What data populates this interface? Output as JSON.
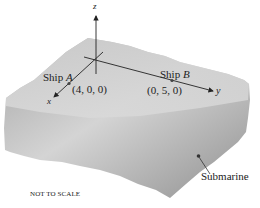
{
  "diagram": {
    "axes": {
      "x_label": "x",
      "y_label": "y",
      "z_label": "z"
    },
    "ship_a": {
      "label_prefix": "Ship",
      "label_var": "A",
      "coords": "(4, 0, 0)"
    },
    "ship_b": {
      "label_prefix": "Ship",
      "label_var": "B",
      "coords": "(0, 5, 0)"
    },
    "submarine": {
      "label": "Submarine"
    },
    "note": "NOT TO SCALE",
    "colors": {
      "block_light": "#d6d6d6",
      "block_dark": "#8e8e8e",
      "axis": "#222222"
    }
  }
}
